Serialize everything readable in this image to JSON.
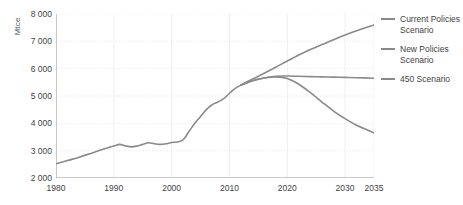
{
  "chart_data": {
    "type": "line",
    "title": "",
    "xlabel": "",
    "ylabel": "Mtce",
    "xlim": [
      1980,
      2035
    ],
    "ylim": [
      2000,
      8000
    ],
    "grid": true,
    "legend_position": "right",
    "xticks": [
      "1980",
      "1990",
      "2000",
      "2010",
      "2020",
      "2030",
      "2035"
    ],
    "xtick_values": [
      1980,
      1990,
      2000,
      2010,
      2020,
      2030,
      2035
    ],
    "yticks": [
      "2 000",
      "3 000",
      "4 000",
      "5 000",
      "6 000",
      "7 000",
      "8 000"
    ],
    "ytick_values": [
      2000,
      3000,
      4000,
      5000,
      6000,
      7000,
      8000
    ],
    "line_color": "#8a8a8a",
    "grid_color": "#e6e6ee",
    "axis_color": "#9a9a9a",
    "series": [
      {
        "name": "Historical",
        "x": [
          1980,
          1982,
          1984,
          1986,
          1988,
          1990,
          1991,
          1992,
          1993,
          1994,
          1995,
          1996,
          1997,
          1998,
          1999,
          2000,
          2001,
          2002,
          2003,
          2004,
          2005,
          2006,
          2007,
          2008,
          2009,
          2010,
          2011,
          2012
        ],
        "values": [
          2520,
          2640,
          2760,
          2900,
          3040,
          3170,
          3230,
          3180,
          3140,
          3170,
          3230,
          3290,
          3250,
          3230,
          3250,
          3300,
          3320,
          3400,
          3700,
          4000,
          4250,
          4500,
          4680,
          4780,
          4900,
          5100,
          5280,
          5400
        ]
      },
      {
        "name": "Current Policies Scenario",
        "x": [
          2012,
          2014,
          2016,
          2018,
          2020,
          2022,
          2024,
          2026,
          2028,
          2030,
          2032,
          2035
        ],
        "values": [
          5400,
          5620,
          5830,
          6050,
          6280,
          6500,
          6700,
          6880,
          7060,
          7230,
          7390,
          7600
        ]
      },
      {
        "name": "New Policies Scenario",
        "x": [
          2012,
          2014,
          2016,
          2018,
          2020,
          2022,
          2024,
          2026,
          2028,
          2030,
          2032,
          2035
        ],
        "values": [
          5400,
          5560,
          5660,
          5720,
          5730,
          5720,
          5710,
          5700,
          5690,
          5680,
          5670,
          5650
        ]
      },
      {
        "name": "450 Scenario",
        "x": [
          2012,
          2014,
          2016,
          2018,
          2020,
          2022,
          2024,
          2026,
          2028,
          2030,
          2032,
          2035
        ],
        "values": [
          5400,
          5560,
          5660,
          5700,
          5640,
          5430,
          5120,
          4780,
          4450,
          4170,
          3930,
          3650
        ]
      }
    ],
    "legend": [
      "Current Policies Scenario",
      "New Policies Scenario",
      "450 Scenario"
    ]
  }
}
